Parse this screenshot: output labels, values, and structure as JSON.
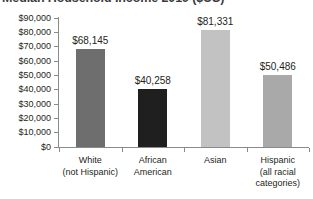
{
  "chart_data": {
    "type": "bar",
    "title": "Median Household Income 2019 ($US)",
    "xlabel": "",
    "ylabel": "",
    "ylim": [
      0,
      90000
    ],
    "grid": false,
    "legend": false,
    "categories": [
      "White (not Hispanic)",
      "African American",
      "Asian",
      "Hispanic (all racial categories)"
    ],
    "category_lines": [
      [
        "White",
        "(not Hispanic)"
      ],
      [
        "African",
        "American"
      ],
      [
        "Asian"
      ],
      [
        "Hispanic",
        "(all racial",
        "categories)"
      ]
    ],
    "values": [
      68145,
      40258,
      81331,
      50486
    ],
    "value_labels": [
      "$68,145",
      "$40,258",
      "$81,331",
      "$50,486"
    ],
    "bar_colors": [
      "#6e6e6e",
      "#1f1f1f",
      "#c2c2c2",
      "#a9a9a9"
    ],
    "ytick_values": [
      90000,
      80000,
      70000,
      60000,
      50000,
      40000,
      30000,
      20000,
      10000,
      0
    ],
    "ytick_labels": [
      "$90,000",
      "$80,000",
      "$70,000",
      "$60,000",
      "$50,000",
      "$40,000",
      "$30,000",
      "$20,000",
      "$10,000",
      "$0"
    ]
  },
  "axis_color": "#8a8a8a",
  "text_color": "#231f20",
  "background": "#ffffff"
}
